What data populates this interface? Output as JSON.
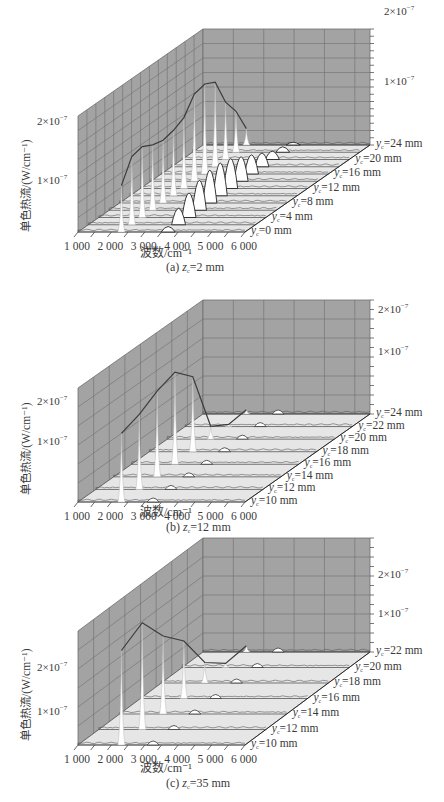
{
  "figure": {
    "ylabel": "单色热流/(W/cm⁻¹)",
    "xlabel": "波数/cm⁻¹",
    "x_ticks": [
      "1 000",
      "2 000",
      "3 000",
      "4 000",
      "5 000",
      "6 000"
    ],
    "y_tick_labels": [
      "1×10⁻⁷",
      "2×10⁻⁷"
    ],
    "colors": {
      "back_wall": "#a3a3a3",
      "grid": "#6e6e6e",
      "floor": "#e6e6e6",
      "peaks": "#ffffff",
      "envelope": "#3c3c3c",
      "text": "#3a3a3a"
    }
  },
  "chart_data": [
    {
      "type": "line",
      "title": "(a) z_c=2 mm",
      "caption_prefix": "(a) ",
      "caption_var": "z",
      "caption_sub": "c",
      "caption_value": "=2 mm",
      "xlabel": "波数/cm⁻¹",
      "ylabel": "单色热流/(W/cm⁻¹)",
      "zlabel": "y_c (mm)",
      "x_ticks": [
        1000,
        2000,
        3000,
        4000,
        5000,
        6000
      ],
      "xlim": [
        1000,
        6000
      ],
      "ylim": [
        0,
        2.2e-07
      ],
      "series_labels": [
        "0 mm",
        "4 mm",
        "8 mm",
        "12 mm",
        "16 mm",
        "20 mm",
        "24 mm"
      ],
      "y_c_mm": [
        0,
        2,
        4,
        6,
        8,
        10,
        12,
        14,
        16,
        18,
        20,
        22,
        24
      ],
      "peak_wavenumber_cm-1": 2300,
      "peak_values": [
        8.5e-08,
        1.25e-07,
        1.3e-07,
        1.2e-07,
        1.15e-07,
        1.2e-07,
        1.3e-07,
        1.6e-07,
        1.65e-07,
        1.55e-07,
        1.05e-07,
        7.5e-08,
        3e-08
      ],
      "secondary_peak_wavenumber_cm-1": 3700,
      "secondary_peak_values": [
        1e-08,
        3e-08,
        4.5e-08,
        5.5e-08,
        6e-08,
        6e-08,
        5.5e-08,
        4.5e-08,
        3.5e-08,
        2.5e-08,
        1.5e-08,
        1e-08,
        5e-09
      ]
    },
    {
      "type": "line",
      "title": "(b) z_c=12 mm",
      "caption_prefix": "(b) ",
      "caption_var": "z",
      "caption_sub": "c",
      "caption_value": "=12 mm",
      "xlabel": "波数/cm⁻¹",
      "ylabel": "单色热流/(W/cm⁻¹)",
      "zlabel": "y_c (mm)",
      "x_ticks": [
        1000,
        2000,
        3000,
        4000,
        5000,
        6000
      ],
      "xlim": [
        1000,
        6000
      ],
      "ylim": [
        0,
        2.8e-07
      ],
      "series_labels": [
        "10 mm",
        "12 mm",
        "14 mm",
        "16 mm",
        "18 mm",
        "20 mm",
        "22 mm",
        "24 mm"
      ],
      "y_c_mm": [
        10,
        12,
        14,
        16,
        18,
        20,
        22,
        24
      ],
      "peak_wavenumber_cm-1": 2300,
      "peak_values": [
        1.6e-07,
        1.75e-07,
        2e-07,
        2.15e-07,
        1.75e-07,
        3e-08,
        5e-09,
        1e-08
      ]
    },
    {
      "type": "line",
      "title": "(c) z_c=35 mm",
      "caption_prefix": "(c) ",
      "caption_var": "z",
      "caption_sub": "c",
      "caption_value": "=35 mm",
      "xlabel": "波数/cm⁻¹",
      "ylabel": "单色热流/(W/cm⁻¹)",
      "zlabel": "y_c (mm)",
      "x_ticks": [
        1000,
        2000,
        3000,
        4000,
        5000,
        6000
      ],
      "xlim": [
        1000,
        6000
      ],
      "ylim": [
        0,
        2.8e-07
      ],
      "series_labels": [
        "10 mm",
        "12 mm",
        "14 mm",
        "16 mm",
        "18 mm",
        "20 mm",
        "22 mm"
      ],
      "y_c_mm": [
        10,
        12,
        14,
        16,
        18,
        20,
        22
      ],
      "peak_wavenumber_cm-1": 2300,
      "peak_values": [
        2.3e-07,
        2.6e-07,
        1.9e-07,
        1.4e-07,
        5e-08,
        1e-08,
        1.5e-08
      ]
    }
  ]
}
